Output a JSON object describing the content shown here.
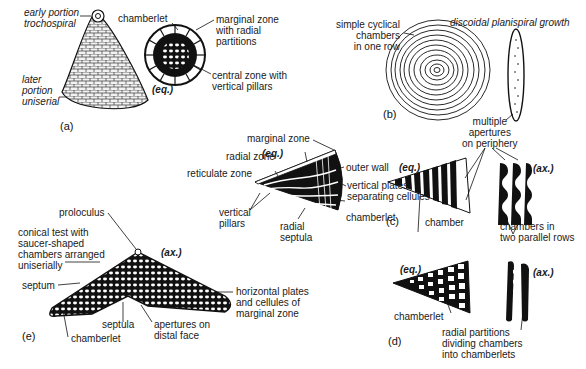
{
  "figure": {
    "panels": [
      {
        "id": "a",
        "label": "(a)",
        "view_label": "(eq.)",
        "annotations": [
          "early portion\ntrochospiral",
          "later\nportion\nuniserial",
          "chamberlet",
          "marginal zone\nwith radial\npartitions",
          "central zone with\nvertical pillars"
        ]
      },
      {
        "id": "b",
        "label": "(b)",
        "annotations": [
          "simple cyclical\nchambers\nin one row",
          "discoidal planispiral growth",
          "multiple\napertures\non periphery"
        ]
      },
      {
        "id": "c",
        "label": "(c)",
        "view_labels": [
          "(eq.)",
          "(ax.)"
        ],
        "annotations": [
          "chamber",
          "chambers in\ntwo parallel rows"
        ]
      },
      {
        "id": "d",
        "label": "(d)",
        "view_labels": [
          "(eq.)",
          "(ax.)"
        ],
        "annotations": [
          "chamberlet",
          "radial partitions\ndividing chambers\ninto chamberlets"
        ]
      },
      {
        "id": "e",
        "label": "(e)",
        "view_labels": [
          "(eq.)",
          "(ax.)"
        ],
        "annotations": [
          "marginal zone",
          "radial zone",
          "reticulate zone",
          "outer wall",
          "vertical plates\nseparating cellules",
          "chamberlet",
          "vertical\npillars",
          "radial\nseptula",
          "proloculus",
          "conical test with\nsaucer-shaped\nchambers arranged\nuniserially",
          "septum",
          "septula",
          "apertures on\ndistal face",
          "chamberlet",
          "horizontal plates\nand cellules of\nmarginal zone"
        ]
      }
    ]
  }
}
